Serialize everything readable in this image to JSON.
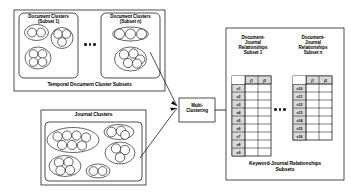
{
  "diagram": {
    "ellipsis": "● ● ●"
  },
  "left": {
    "temporal_panel": {
      "caption": "Temporal Document Cluster Subsets",
      "subsets": [
        {
          "label": "Document  Clusters\n(Subset  1)",
          "clusters": [
            {
              "members": 2
            },
            {
              "members": 3
            },
            {
              "members": 4
            }
          ]
        },
        {
          "label": "Document  Clusters\n(Subset  n)",
          "clusters": [
            {
              "members": 3
            },
            {
              "members": 5
            }
          ]
        }
      ],
      "between_subsets_ellipsis": "● ● ●"
    },
    "journal_panel": {
      "label": "Journal Clusters",
      "clusters": [
        {
          "members": 7
        },
        {
          "members": 3
        },
        {
          "members": 3
        },
        {
          "members": 4
        },
        {
          "members": 2
        }
      ]
    }
  },
  "process": {
    "node_label": "Multi-\nClustering",
    "input_arrow_names": [
      "temporal-to-multi-clustering",
      "journal-to-multi-clustering"
    ],
    "output_arrow_name": "multi-clustering-to-relationships"
  },
  "right": {
    "panel_caption": "Keyword-Journal Relationships\nSubsets",
    "tables": [
      {
        "title": "Document-\nJournal\nRelationships\nSubset 1",
        "columns": [
          "",
          "j1",
          "j2"
        ],
        "rows": [
          {
            "label": "v1",
            "cells": [
              "",
              ""
            ]
          },
          {
            "label": "v2",
            "cells": [
              "",
              ""
            ]
          },
          {
            "label": "v3",
            "cells": [
              "",
              ""
            ]
          },
          {
            "label": "v4",
            "cells": [
              "",
              ""
            ]
          },
          {
            "label": "v5",
            "cells": [
              "",
              ""
            ]
          },
          {
            "label": "v6",
            "cells": [
              "",
              ""
            ]
          },
          {
            "label": "v7",
            "cells": [
              "",
              ""
            ]
          },
          {
            "label": "v8",
            "cells": [
              "",
              ""
            ]
          },
          {
            "label": "v9",
            "cells": [
              "",
              ""
            ]
          }
        ]
      },
      {
        "title": "Document-\nJournal\nRelationships\nSubset n",
        "columns": [
          "",
          "j1",
          "j2"
        ],
        "rows": [
          {
            "label": "v10",
            "cells": [
              "",
              ""
            ]
          },
          {
            "label": "v11",
            "cells": [
              "",
              ""
            ]
          },
          {
            "label": "v12",
            "cells": [
              "",
              ""
            ]
          },
          {
            "label": "v13",
            "cells": [
              "",
              ""
            ]
          },
          {
            "label": "v14",
            "cells": [
              "",
              ""
            ]
          },
          {
            "label": "v15",
            "cells": [
              "",
              ""
            ]
          },
          {
            "label": "v16",
            "cells": [
              "",
              ""
            ]
          }
        ]
      }
    ],
    "between_tables_ellipsis": "● ● ●"
  },
  "colors": {
    "stroke": "#000000",
    "fill": "#ffffff",
    "header_fill": "#d9d9d9",
    "text": "#000000"
  }
}
